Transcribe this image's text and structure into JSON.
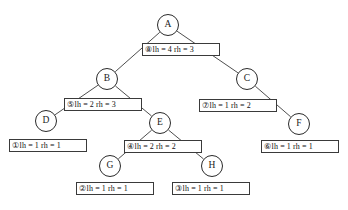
{
  "diagram": {
    "stroke_color": "#2a2a2a",
    "background_color": "#ffffff",
    "nodes": [
      {
        "id": "A",
        "label": "A",
        "x": 168,
        "y": 25,
        "r": 11
      },
      {
        "id": "B",
        "label": "B",
        "x": 107,
        "y": 79,
        "r": 11
      },
      {
        "id": "C",
        "label": "C",
        "x": 247,
        "y": 79,
        "r": 11
      },
      {
        "id": "D",
        "label": "D",
        "x": 46,
        "y": 121,
        "r": 11
      },
      {
        "id": "E",
        "label": "E",
        "x": 160,
        "y": 123,
        "r": 11
      },
      {
        "id": "F",
        "label": "F",
        "x": 299,
        "y": 124,
        "r": 11
      },
      {
        "id": "G",
        "label": "G",
        "x": 110,
        "y": 166,
        "r": 11
      },
      {
        "id": "H",
        "label": "H",
        "x": 212,
        "y": 166,
        "r": 11
      }
    ],
    "edges": [
      {
        "from": "A",
        "to": "B"
      },
      {
        "from": "A",
        "to": "C"
      },
      {
        "from": "B",
        "to": "D"
      },
      {
        "from": "B",
        "to": "E"
      },
      {
        "from": "C",
        "to": "F"
      },
      {
        "from": "E",
        "to": "G"
      },
      {
        "from": "E",
        "to": "H"
      }
    ],
    "annotations": [
      {
        "id": "ann-8",
        "for": "A",
        "order": "⑧",
        "order_number": 8,
        "text": "lh = 4  rh = 3",
        "lh": 4,
        "rh": 3,
        "x": 142,
        "y": 43,
        "w": 78,
        "h": 13
      },
      {
        "id": "ann-5",
        "for": "B",
        "order": "⑤",
        "order_number": 5,
        "text": "lh = 2  rh = 3",
        "lh": 2,
        "rh": 3,
        "x": 64,
        "y": 98,
        "w": 78,
        "h": 13
      },
      {
        "id": "ann-7",
        "for": "C",
        "order": "⑦",
        "order_number": 7,
        "text": "lh = 1  rh = 2",
        "lh": 1,
        "rh": 2,
        "x": 199,
        "y": 99,
        "w": 78,
        "h": 13
      },
      {
        "id": "ann-1",
        "for": "D",
        "order": "①",
        "order_number": 1,
        "text": "lh = 1  rh = 1",
        "lh": 1,
        "rh": 1,
        "x": 9,
        "y": 139,
        "w": 78,
        "h": 13
      },
      {
        "id": "ann-4",
        "for": "E",
        "order": "④",
        "order_number": 4,
        "text": "lh = 2  rh = 2",
        "lh": 2,
        "rh": 2,
        "x": 124,
        "y": 140,
        "w": 78,
        "h": 13
      },
      {
        "id": "ann-6",
        "for": "F",
        "order": "⑥",
        "order_number": 6,
        "text": "lh = 1  rh = 1",
        "lh": 1,
        "rh": 1,
        "x": 261,
        "y": 140,
        "w": 78,
        "h": 13
      },
      {
        "id": "ann-2",
        "for": "G",
        "order": "②",
        "order_number": 2,
        "text": "lh = 1  rh = 1",
        "lh": 1,
        "rh": 1,
        "x": 76,
        "y": 182,
        "w": 78,
        "h": 13
      },
      {
        "id": "ann-3",
        "for": "H",
        "order": "③",
        "order_number": 3,
        "text": "lh = 1  rh = 1",
        "lh": 1,
        "rh": 1,
        "x": 172,
        "y": 182,
        "w": 78,
        "h": 13
      }
    ],
    "caption": ""
  }
}
